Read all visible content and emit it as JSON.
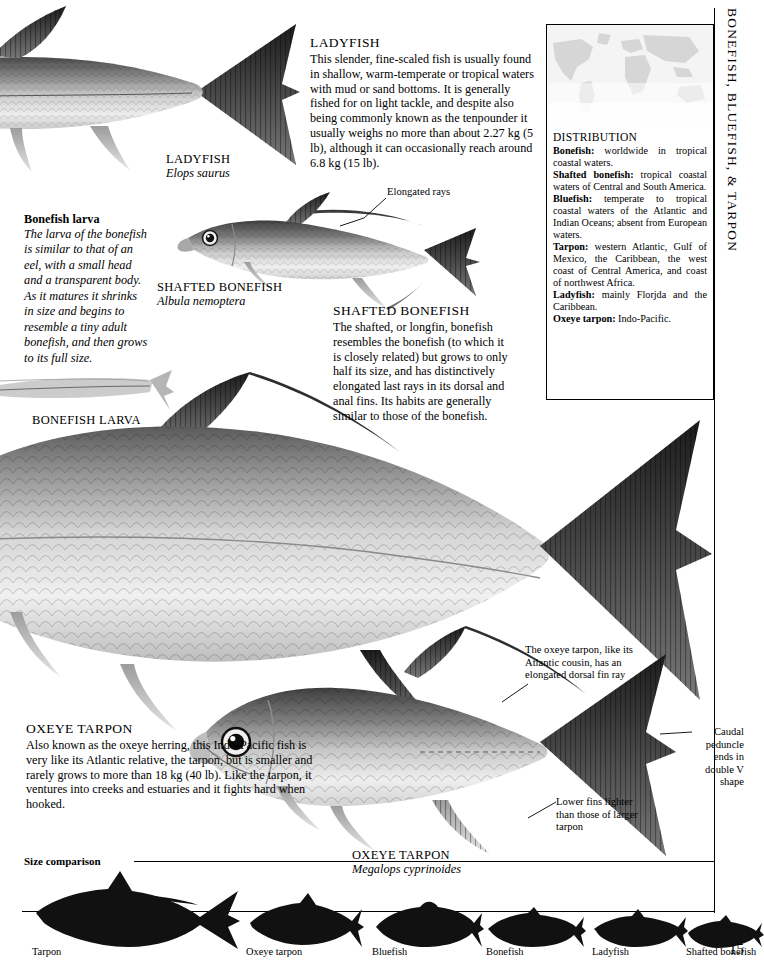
{
  "running_head": "BONEFISH, BLUEFISH, & TARPON",
  "page_number": "15",
  "ladyfish": {
    "heading": "Ladyfish",
    "body": "This slender, fine-scaled fish is usually found in shallow, warm-temperate or tropical waters with mud or sand bottoms. It is generally fished for on light tackle, and despite also being commonly known as the tenpounder it usually weighs no more than about 2.27 kg (5 lb), although it can occasionally reach around 6.8 kg (15 lb).",
    "plate_name": "LADYFISH",
    "plate_latin": "Elops saurus"
  },
  "bonefish_larva": {
    "heading": "Bonefish larva",
    "body": "The larva of the bonefish is similar to that of an eel, with a small head and a transparent body. As it matures it shrinks in size and begins to resemble a tiny adult bonefish, and then grows to its full size.",
    "plate_name": "BONEFISH LARVA"
  },
  "shafted_bonefish": {
    "heading": "Shafted Bonefish",
    "body": "The shafted, or longfin, bonefish resembles the bonefish (to which it is closely related) but grows to only half its size, and has distinctively elongated last rays in its dorsal and anal fins. Its habits are generally similar to those of the bonefish.",
    "plate_name": "SHAFTED BONEFISH",
    "plate_latin": "Albula nemoptera",
    "annotation_elongated_rays": "Elongated rays"
  },
  "oxeye_tarpon": {
    "heading": "Oxeye Tarpon",
    "body": "Also known as the oxeye herring, this Indo-Pacific fish is very like its Atlantic relative, the tarpon, but is smaller and rarely grows to more than 18 kg (40 lb). Like the tarpon, it ventures into creeks and estuaries and it fights hard when hooked.",
    "plate_name": "OXEYE TARPON",
    "plate_latin": "Megalops cyprinoides",
    "annotation_dorsal": "The oxeye tarpon, like its Atlantic cousin, has an elongated dorsal fin ray",
    "annotation_caudal": "Caudal peduncle ends in double V shape",
    "annotation_lower_fins": "Lower fins lighter than those of larger tarpon"
  },
  "distribution": {
    "heading": "Distribution",
    "entries": [
      {
        "name": "Bonefish:",
        "text": " worldwide in tropical coastal waters."
      },
      {
        "name": "Shafted bonefish:",
        "text": " tropical coastal waters of Central and South America."
      },
      {
        "name": "Bluefish:",
        "text": " temperate to tropical coastal waters of the Atlantic and Indian Oceans; absent from European waters."
      },
      {
        "name": "Tarpon:",
        "text": " western Atlantic, Gulf of Mexico, the Caribbean, the west coast of Central America, and coast of northwest Africa."
      },
      {
        "name": "Ladyfish:",
        "text": " mainly Florjda and the Caribbean."
      },
      {
        "name": "Oxeye tarpon:",
        "text": " Indo-Pacific."
      }
    ]
  },
  "size_comparison": {
    "title": "Size comparison",
    "items": [
      {
        "label": "Tarpon",
        "scale": 1.0
      },
      {
        "label": "Oxeye tarpon",
        "scale": 0.56
      },
      {
        "label": "Bluefish",
        "scale": 0.5
      },
      {
        "label": "Bonefish",
        "scale": 0.44
      },
      {
        "label": "Ladyfish",
        "scale": 0.42
      },
      {
        "label": "Shafted bonefish",
        "scale": 0.34
      }
    ]
  },
  "colors": {
    "ink": "#000000",
    "paper": "#ffffff",
    "map_land": "#d8d8d8",
    "map_sea": "#f2f2f2"
  }
}
